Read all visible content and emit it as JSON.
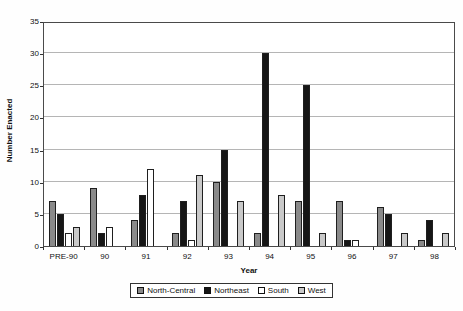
{
  "figure": {
    "background": "#fefefe",
    "text_color": "#111111"
  },
  "colors": {
    "plot_border": "#4a4a4a",
    "gridline": "#b5b5b5",
    "bar_outline": "#1f1f1f",
    "axis_tick": "#333333"
  },
  "axes": {
    "y_title": "Number Enacted",
    "x_title": "Year",
    "y_tick_labels": [
      "0",
      "5",
      "10",
      "15",
      "20",
      "25",
      "30",
      "35"
    ]
  },
  "chart_data": {
    "type": "bar",
    "title": "",
    "xlabel": "Year",
    "ylabel": "Number Enacted",
    "ylim": [
      0,
      35
    ],
    "ytick_step": 5,
    "grid": true,
    "legend_position": "bottom-center",
    "categories": [
      "PRE-90",
      "90",
      "91",
      "92",
      "93",
      "94",
      "95",
      "96",
      "97",
      "98"
    ],
    "series": [
      {
        "name": "North-Central",
        "color": "#8a8a8a",
        "values": [
          7,
          9,
          4,
          2,
          10,
          2,
          7,
          7,
          6,
          1
        ]
      },
      {
        "name": "Northeast",
        "color": "#161616",
        "values": [
          5,
          2,
          8,
          7,
          15,
          30,
          25,
          1,
          5,
          4
        ]
      },
      {
        "name": "South",
        "color": "#ffffff",
        "values": [
          2,
          3,
          12,
          1,
          0,
          0,
          0,
          1,
          0,
          0
        ]
      },
      {
        "name": "West",
        "color": "#c9c9c9",
        "values": [
          3,
          0,
          0,
          11,
          7,
          8,
          2,
          0,
          2,
          2
        ]
      }
    ]
  }
}
